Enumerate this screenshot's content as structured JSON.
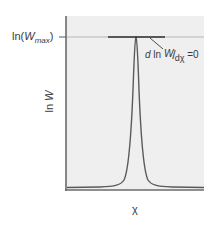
{
  "figure": {
    "y_axis": {
      "label_prefix": "ln",
      "label_var": "W",
      "max_tick_prefix": "ln(",
      "max_tick_var": "W",
      "max_tick_sub": "max",
      "max_tick_suffix": ")"
    },
    "x_axis": {
      "label": "χ"
    },
    "annotation": {
      "d1": "d",
      "ln": " ln ",
      "num_var": "W",
      "slash": "/",
      "den": "dχ",
      "eq": " =0"
    },
    "colors": {
      "panel_fill": "#efefef",
      "axis": "#6b6b6b",
      "curve": "#5a5a5a",
      "tangent": "#2e2e2e",
      "reference_line": "#b8b8b8",
      "text": "#3a3a3a"
    }
  }
}
